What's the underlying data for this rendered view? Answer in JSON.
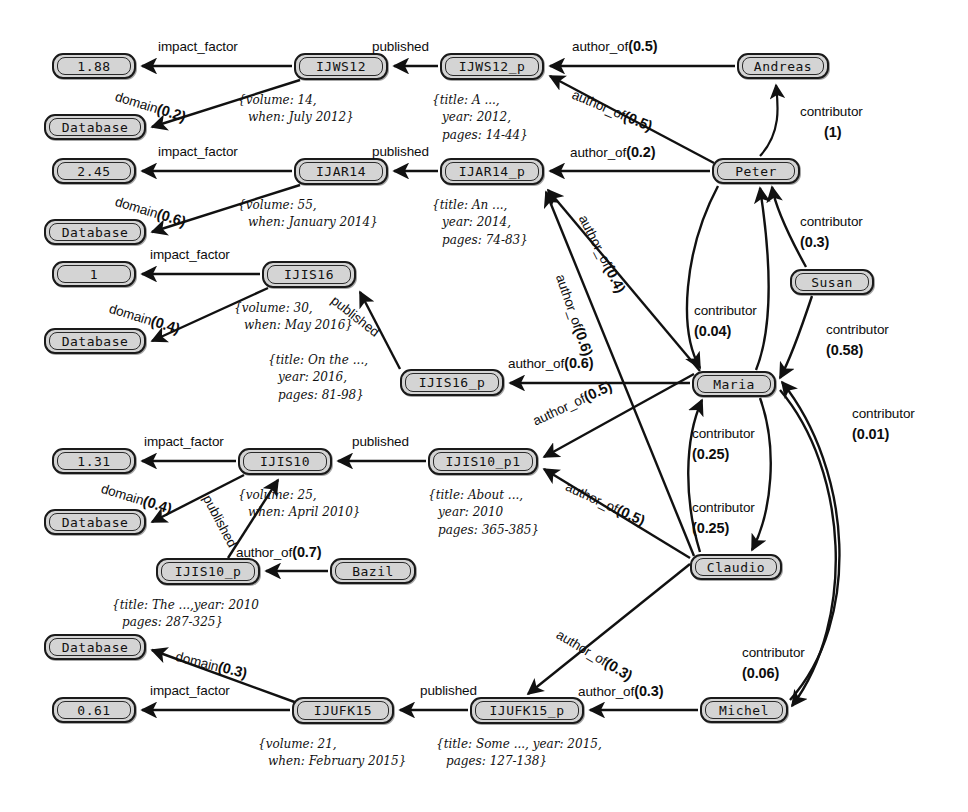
{
  "diagram": {
    "node_fill": "#d4d4d4",
    "node_stroke": "#1a1a1a",
    "edge_color": "#111111"
  },
  "nodes": [
    {
      "id": "if_1_88",
      "label": "1.88",
      "kind": "value",
      "x": 52,
      "y": 53,
      "w": 84,
      "h": 26
    },
    {
      "id": "db1",
      "label": "Database",
      "kind": "value",
      "x": 44,
      "y": 114,
      "w": 102,
      "h": 26
    },
    {
      "id": "ijws12",
      "label": "IJWS12",
      "kind": "journal",
      "x": 294,
      "y": 53,
      "w": 94,
      "h": 27
    },
    {
      "id": "ijws12p",
      "label": "IJWS12_p",
      "kind": "paper",
      "x": 440,
      "y": 53,
      "w": 104,
      "h": 27
    },
    {
      "id": "andreas",
      "label": "Andreas",
      "kind": "person",
      "x": 737,
      "y": 53,
      "w": 92,
      "h": 26
    },
    {
      "id": "if_2_45",
      "label": "2.45",
      "kind": "value",
      "x": 52,
      "y": 158,
      "w": 84,
      "h": 26
    },
    {
      "id": "db2",
      "label": "Database",
      "kind": "value",
      "x": 44,
      "y": 219,
      "w": 102,
      "h": 26
    },
    {
      "id": "ijar14",
      "label": "IJAR14",
      "kind": "journal",
      "x": 294,
      "y": 158,
      "w": 94,
      "h": 27
    },
    {
      "id": "ijar14p",
      "label": "IJAR14_p",
      "kind": "paper",
      "x": 440,
      "y": 158,
      "w": 104,
      "h": 27
    },
    {
      "id": "peter",
      "label": "Peter",
      "kind": "person",
      "x": 712,
      "y": 158,
      "w": 88,
      "h": 26
    },
    {
      "id": "if_1",
      "label": "1",
      "kind": "value",
      "x": 52,
      "y": 261,
      "w": 84,
      "h": 26
    },
    {
      "id": "db3",
      "label": "Database",
      "kind": "value",
      "x": 44,
      "y": 328,
      "w": 102,
      "h": 26
    },
    {
      "id": "ijis16",
      "label": "IJIS16",
      "kind": "journal",
      "x": 262,
      "y": 261,
      "w": 94,
      "h": 27
    },
    {
      "id": "ijis16p",
      "label": "IJIS16_p",
      "kind": "paper",
      "x": 400,
      "y": 369,
      "w": 104,
      "h": 27
    },
    {
      "id": "susan",
      "label": "Susan",
      "kind": "person",
      "x": 790,
      "y": 269,
      "w": 84,
      "h": 26
    },
    {
      "id": "maria",
      "label": "Maria",
      "kind": "person",
      "x": 692,
      "y": 371,
      "w": 84,
      "h": 26
    },
    {
      "id": "if_1_31",
      "label": "1.31",
      "kind": "value",
      "x": 52,
      "y": 448,
      "w": 84,
      "h": 26
    },
    {
      "id": "db4",
      "label": "Database",
      "kind": "value",
      "x": 44,
      "y": 509,
      "w": 102,
      "h": 26
    },
    {
      "id": "ijis10",
      "label": "IJIS10",
      "kind": "journal",
      "x": 238,
      "y": 448,
      "w": 94,
      "h": 27
    },
    {
      "id": "ijis10p1",
      "label": "IJIS10_p1",
      "kind": "paper",
      "x": 428,
      "y": 448,
      "w": 110,
      "h": 27
    },
    {
      "id": "ijis10p",
      "label": "IJIS10_p",
      "kind": "paper",
      "x": 156,
      "y": 558,
      "w": 104,
      "h": 27
    },
    {
      "id": "bazil",
      "label": "Bazil",
      "kind": "person",
      "x": 330,
      "y": 558,
      "w": 86,
      "h": 26
    },
    {
      "id": "claudio",
      "label": "Claudio",
      "kind": "person",
      "x": 690,
      "y": 554,
      "w": 92,
      "h": 26
    },
    {
      "id": "db5",
      "label": "Database",
      "kind": "value",
      "x": 44,
      "y": 634,
      "w": 102,
      "h": 26
    },
    {
      "id": "if_0_61",
      "label": "0.61",
      "kind": "value",
      "x": 52,
      "y": 697,
      "w": 84,
      "h": 26
    },
    {
      "id": "ijufk15",
      "label": "IJUFK15",
      "kind": "journal",
      "x": 292,
      "y": 697,
      "w": 102,
      "h": 27
    },
    {
      "id": "ijufk15p",
      "label": "IJUFK15_p",
      "kind": "paper",
      "x": 470,
      "y": 697,
      "w": 114,
      "h": 27
    },
    {
      "id": "michel",
      "label": "Michel",
      "kind": "person",
      "x": 700,
      "y": 697,
      "w": 88,
      "h": 26
    }
  ],
  "edge_labels": [
    {
      "id": "e1",
      "text": "impact_factor",
      "weight": "",
      "x": 158,
      "y": 38,
      "rot": 0
    },
    {
      "id": "e2",
      "text": "domain",
      "weight": "(0.2)",
      "x": 118,
      "y": 88,
      "rot": 17
    },
    {
      "id": "e3",
      "text": "published",
      "weight": "",
      "x": 372,
      "y": 38,
      "rot": 0
    },
    {
      "id": "e4",
      "text": "author_of",
      "weight": "(0.5)",
      "x": 572,
      "y": 38,
      "rot": 0
    },
    {
      "id": "e5",
      "text": "author_of",
      "weight": "(0.5)",
      "x": 576,
      "y": 86,
      "rot": 23
    },
    {
      "id": "e6",
      "text": "contributor",
      "weight": "",
      "x": 800,
      "y": 104,
      "rot": 0
    },
    {
      "id": "e6b",
      "text": "(1)",
      "weight": "",
      "x": 824,
      "y": 124,
      "rot": 0
    },
    {
      "id": "e7",
      "text": "impact_factor",
      "weight": "",
      "x": 158,
      "y": 143,
      "rot": 0
    },
    {
      "id": "e8",
      "text": "domain",
      "weight": "(0.6)",
      "x": 118,
      "y": 193,
      "rot": 17
    },
    {
      "id": "e9",
      "text": "published",
      "weight": "",
      "x": 372,
      "y": 143,
      "rot": 0
    },
    {
      "id": "e10",
      "text": "author_of",
      "weight": "(0.2)",
      "x": 570,
      "y": 144,
      "rot": 0
    },
    {
      "id": "e11",
      "text": "impact_factor",
      "weight": "",
      "x": 150,
      "y": 246,
      "rot": 0
    },
    {
      "id": "e12",
      "text": "domain",
      "weight": "(0.4)",
      "x": 112,
      "y": 300,
      "rot": 17
    },
    {
      "id": "e13",
      "text": "published",
      "weight": "",
      "x": 338,
      "y": 292,
      "rot": 38
    },
    {
      "id": "e14",
      "text": "author_of",
      "weight": "(0.6)",
      "x": 508,
      "y": 355,
      "rot": 0
    },
    {
      "id": "e15",
      "text": "author_of",
      "weight": "(0.4)",
      "x": 590,
      "y": 212,
      "rot": 63
    },
    {
      "id": "e16",
      "text": "author_of",
      "weight": "(0.6)",
      "x": 568,
      "y": 272,
      "rot": 71
    },
    {
      "id": "e17",
      "text": "contributor",
      "weight": "",
      "x": 800,
      "y": 214,
      "rot": 0
    },
    {
      "id": "e17b",
      "text": "(0.3)",
      "weight": "",
      "x": 800,
      "y": 234,
      "rot": 0
    },
    {
      "id": "e18",
      "text": "contributor",
      "weight": "",
      "x": 694,
      "y": 303,
      "rot": 0
    },
    {
      "id": "e18b",
      "text": "(0.04)",
      "weight": "",
      "x": 694,
      "y": 323,
      "rot": 0
    },
    {
      "id": "e19",
      "text": "contributor",
      "weight": "",
      "x": 826,
      "y": 322,
      "rot": 0
    },
    {
      "id": "e19b",
      "text": "(0.58)",
      "weight": "",
      "x": 826,
      "y": 342,
      "rot": 0
    },
    {
      "id": "e20",
      "text": "contributor",
      "weight": "",
      "x": 852,
      "y": 406,
      "rot": 0
    },
    {
      "id": "e20b",
      "text": "(0.01)",
      "weight": "",
      "x": 852,
      "y": 426,
      "rot": 0
    },
    {
      "id": "e21",
      "text": "impact_factor",
      "weight": "",
      "x": 144,
      "y": 433,
      "rot": 0
    },
    {
      "id": "e22",
      "text": "domain",
      "weight": "(0.4)",
      "x": 104,
      "y": 480,
      "rot": 17
    },
    {
      "id": "e23",
      "text": "published",
      "weight": "",
      "x": 352,
      "y": 433,
      "rot": 0
    },
    {
      "id": "e24",
      "text": "published",
      "weight": "",
      "x": 214,
      "y": 492,
      "rot": 62
    },
    {
      "id": "e25",
      "text": "author_of",
      "weight": "(0.7)",
      "x": 236,
      "y": 544,
      "rot": 0
    },
    {
      "id": "e26",
      "text": "author_of",
      "weight": "(0.5)",
      "x": 530,
      "y": 414,
      "rot": -25
    },
    {
      "id": "e27",
      "text": "author_of",
      "weight": "(0.5)",
      "x": 570,
      "y": 478,
      "rot": 25
    },
    {
      "id": "e28",
      "text": "contributor",
      "weight": "",
      "x": 692,
      "y": 426,
      "rot": 0
    },
    {
      "id": "e28b",
      "text": "(0.25)",
      "weight": "",
      "x": 692,
      "y": 446,
      "rot": 0
    },
    {
      "id": "e29",
      "text": "contributor",
      "weight": "",
      "x": 692,
      "y": 500,
      "rot": 0
    },
    {
      "id": "e29b",
      "text": "(0.25)",
      "weight": "",
      "x": 692,
      "y": 520,
      "rot": 0
    },
    {
      "id": "e30",
      "text": "domain",
      "weight": "(0.3)",
      "x": 178,
      "y": 648,
      "rot": 14
    },
    {
      "id": "e31",
      "text": "impact_factor",
      "weight": "",
      "x": 150,
      "y": 682,
      "rot": 0
    },
    {
      "id": "e32",
      "text": "published",
      "weight": "",
      "x": 420,
      "y": 682,
      "rot": 0
    },
    {
      "id": "e33",
      "text": "author_of",
      "weight": "(0.3)",
      "x": 578,
      "y": 683,
      "rot": 0
    },
    {
      "id": "e34",
      "text": "author_of",
      "weight": "(0.3)",
      "x": 562,
      "y": 626,
      "rot": 31
    },
    {
      "id": "e35",
      "text": "contributor",
      "weight": "",
      "x": 742,
      "y": 645,
      "rot": 0
    },
    {
      "id": "e35b",
      "text": "(0.06)",
      "weight": "",
      "x": 742,
      "y": 665,
      "rot": 0
    }
  ],
  "attributes": [
    {
      "id": "a_ijws12",
      "x": 238,
      "y": 92,
      "lines": [
        "{volume: 14,",
        "when: July 2012}"
      ]
    },
    {
      "id": "a_ijws12p",
      "x": 432,
      "y": 92,
      "lines": [
        "{title: A ...,",
        "year: 2012,",
        "pages: 14-44}"
      ]
    },
    {
      "id": "a_ijar14",
      "x": 238,
      "y": 197,
      "lines": [
        "{volume: 55,",
        "when: January 2014}"
      ]
    },
    {
      "id": "a_ijar14p",
      "x": 432,
      "y": 197,
      "lines": [
        "{title: An ...,",
        "year: 2014,",
        "pages: 74-83}"
      ]
    },
    {
      "id": "a_ijis16",
      "x": 234,
      "y": 300,
      "lines": [
        "{volume: 30,",
        "when: May 2016}"
      ]
    },
    {
      "id": "a_ijis16p",
      "x": 268,
      "y": 352,
      "lines": [
        "{title: On the ...,",
        "year: 2016,",
        "pages: 81-98}"
      ]
    },
    {
      "id": "a_ijis10",
      "x": 238,
      "y": 487,
      "lines": [
        "{volume: 25,",
        "when: April 2010}"
      ]
    },
    {
      "id": "a_ijis10p1",
      "x": 428,
      "y": 487,
      "lines": [
        "{title: About ...,",
        "year: 2010",
        "pages: 365-385}"
      ]
    },
    {
      "id": "a_ijis10p",
      "x": 112,
      "y": 597,
      "lines": [
        "{title: The ...,year: 2010",
        "pages: 287-325}"
      ]
    },
    {
      "id": "a_ijufk15",
      "x": 258,
      "y": 736,
      "lines": [
        "{volume: 21,",
        "when: February 2015}"
      ]
    },
    {
      "id": "a_ijufk15p",
      "x": 436,
      "y": 736,
      "lines": [
        "{title: Some ..., year: 2015,",
        "pages: 127-138}"
      ]
    }
  ]
}
